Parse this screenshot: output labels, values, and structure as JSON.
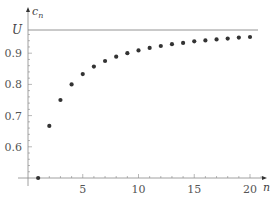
{
  "chart_data": {
    "type": "scatter",
    "title": "",
    "xlabel": "n",
    "ylabel": "c_n",
    "ylabel_main": "c",
    "ylabel_sub": "n",
    "x": [
      1,
      2,
      3,
      4,
      5,
      6,
      7,
      8,
      9,
      10,
      11,
      12,
      13,
      14,
      15,
      16,
      17,
      18,
      19,
      20
    ],
    "series": [
      {
        "name": "c_n",
        "values": [
          0.5,
          0.667,
          0.75,
          0.8,
          0.833,
          0.857,
          0.875,
          0.889,
          0.9,
          0.909,
          0.917,
          0.923,
          0.929,
          0.933,
          0.938,
          0.941,
          0.944,
          0.947,
          0.95,
          0.952
        ]
      }
    ],
    "x_ticks": [
      "5",
      "10",
      "15",
      "20"
    ],
    "x_tick_values": [
      5,
      10,
      15,
      20
    ],
    "y_ticks": [
      "0.6",
      "0.7",
      "0.8",
      "0.9"
    ],
    "y_tick_values": [
      0.6,
      0.7,
      0.8,
      0.9
    ],
    "reference_line": {
      "label": "U",
      "value": 0.975
    },
    "xlim": [
      0.1,
      21
    ],
    "ylim": [
      0.5,
      1.0
    ],
    "grid": false,
    "legend": "none",
    "colors": {
      "points": "#333333",
      "axis": "#888888",
      "reference_line": "#888888"
    }
  }
}
